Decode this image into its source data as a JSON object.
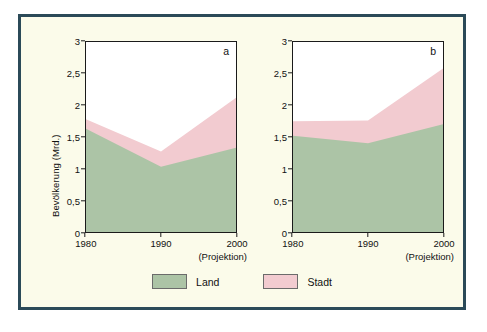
{
  "figure": {
    "panel_a_letter": "a",
    "panel_b_letter": "b",
    "y_axis_title": "Bevölkerung (Mrd.)",
    "projection_note": "(Projektion)"
  },
  "legend": {
    "items": [
      {
        "label": "Land",
        "color": "#acc4a6"
      },
      {
        "label": "Stadt",
        "color": "#f2cbd0"
      }
    ]
  },
  "colors": {
    "land": "#acc4a6",
    "stadt": "#f2cbd0",
    "frame_border": "#2b4a58",
    "frame_background": "#fbfbea",
    "plot_background": "#ffffff",
    "axis": "#1a1a1a"
  },
  "chart_data": [
    {
      "type": "area",
      "id": "a",
      "title": "a",
      "stacked": true,
      "x": [
        1980,
        1990,
        2000
      ],
      "categories": [
        "1980",
        "1990",
        "2000"
      ],
      "xlabel": "",
      "ylabel": "Bevölkerung (Mrd.)",
      "ylim": [
        0,
        3
      ],
      "yticks": [
        0,
        0.5,
        1,
        1.5,
        2,
        2.5,
        3
      ],
      "ytick_labels": [
        "0",
        "0,5",
        "1",
        "1,5",
        "2",
        "2,5",
        "3"
      ],
      "xticks": [
        1980,
        1990,
        2000
      ],
      "xtick_labels": [
        "1980",
        "1990",
        "2000"
      ],
      "grid": false,
      "legend_position": "bottom",
      "annotations": [
        "(Projektion)"
      ],
      "series": [
        {
          "name": "Land",
          "color": "#acc4a6",
          "values": [
            1.63,
            1.03,
            1.33
          ]
        },
        {
          "name": "Stadt",
          "color": "#f2cbd0",
          "values": [
            0.15,
            0.24,
            0.79
          ]
        }
      ],
      "cumulative_tops": [
        1.78,
        1.27,
        2.12
      ]
    },
    {
      "type": "area",
      "id": "b",
      "title": "b",
      "stacked": true,
      "x": [
        1980,
        1990,
        2000
      ],
      "categories": [
        "1980",
        "1990",
        "2000"
      ],
      "xlabel": "",
      "ylabel": "",
      "ylim": [
        0,
        3
      ],
      "yticks": [
        0,
        0.5,
        1,
        1.5,
        2,
        2.5,
        3
      ],
      "ytick_labels": [
        "0",
        "0,5",
        "1",
        "1,5",
        "2",
        "2,5",
        "3"
      ],
      "xticks": [
        1980,
        1990,
        2000
      ],
      "xtick_labels": [
        "1980",
        "1990",
        "2000"
      ],
      "grid": false,
      "legend_position": "bottom",
      "annotations": [
        "(Projektion)"
      ],
      "series": [
        {
          "name": "Land",
          "color": "#acc4a6",
          "values": [
            1.52,
            1.4,
            1.7
          ]
        },
        {
          "name": "Stadt",
          "color": "#f2cbd0",
          "values": [
            0.23,
            0.36,
            0.88
          ]
        }
      ],
      "cumulative_tops": [
        1.75,
        1.76,
        2.58
      ]
    }
  ]
}
